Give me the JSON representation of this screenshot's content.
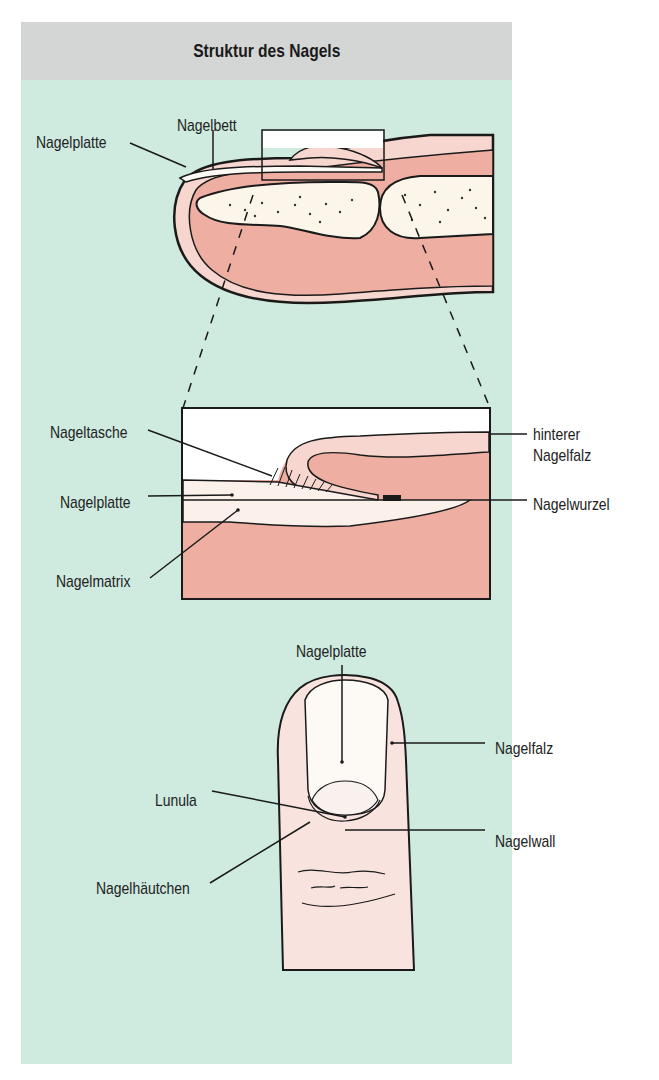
{
  "header": {
    "title": "Struktur des Nagels"
  },
  "figures": {
    "side_view": {
      "labels": {
        "nail_plate": "Nagelplatte",
        "nail_bed": "Nagelbett"
      }
    },
    "detail_view": {
      "labels": {
        "nail_pocket": "Nageltasche",
        "nail_plate": "Nagelplatte",
        "nail_matrix": "Nagelmatrix",
        "posterior_fold_line1": "hinterer",
        "posterior_fold_line2": "Nagelfalz",
        "nail_root": "Nagelwurzel"
      }
    },
    "top_view": {
      "labels": {
        "nail_plate": "Nagelplatte",
        "nail_fold": "Nagelfalz",
        "lunula": "Lunula",
        "nail_wall": "Nagelwall",
        "cuticle": "Nagelhäutchen"
      }
    }
  },
  "colors": {
    "header_bg": "#d4d6d5",
    "panel_bg": "#cfeadf",
    "flesh": "#eeaea2",
    "skin_light": "#f6d6cf",
    "bone": "#fbf5ea",
    "nail_white": "#fdfaf6",
    "outline": "#1a1a1a"
  }
}
